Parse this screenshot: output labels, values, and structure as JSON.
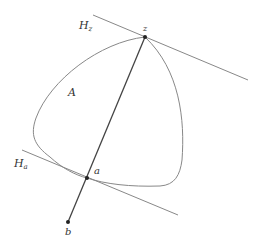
{
  "diagram": {
    "labels": {
      "set_A": "A",
      "hyperplane_z": "H",
      "hyperplane_z_sub": "z",
      "hyperplane_a": "H",
      "hyperplane_a_sub": "a",
      "point_z": "z",
      "point_a": "a",
      "point_b": "b"
    },
    "points": {
      "z": [
        145,
        37
      ],
      "a": [
        87,
        178
      ],
      "b": [
        68,
        222
      ]
    },
    "colors": {
      "stroke": "#777777",
      "segment": "#333333",
      "point": "#222222",
      "background": "#ffffff"
    }
  }
}
